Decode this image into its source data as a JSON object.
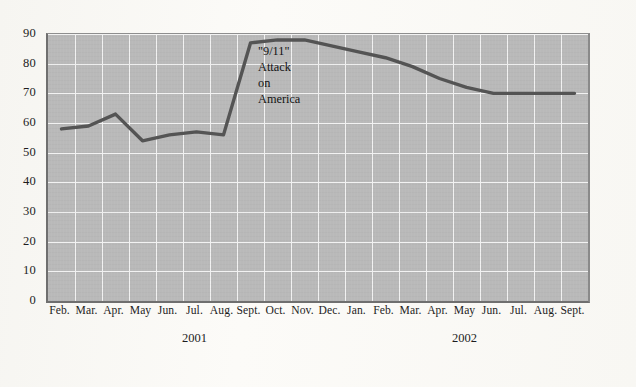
{
  "chart_data": {
    "type": "line",
    "title": "",
    "subtitle": "",
    "xlabel": "",
    "ylabel": "",
    "ylim": [
      0,
      90
    ],
    "ytick_step": 10,
    "yticks": [
      0,
      10,
      20,
      30,
      40,
      50,
      60,
      70,
      80,
      90
    ],
    "ytick_labels": [
      "0",
      "10",
      "20",
      "30",
      "40",
      "50",
      "60",
      "70",
      "80",
      "90"
    ],
    "grid": true,
    "legend": null,
    "legend_position": "none",
    "categories": [
      "Feb.",
      "Mar.",
      "Apr.",
      "May",
      "Jun.",
      "Jul.",
      "Aug.",
      "Sept.",
      "Oct.",
      "Nov.",
      "Dec.",
      "Jan.",
      "Feb.",
      "Mar.",
      "Apr.",
      "May",
      "Jun.",
      "Jul.",
      "Aug.",
      "Sept."
    ],
    "values": [
      58,
      59,
      63,
      54,
      56,
      57,
      56,
      87,
      88,
      88,
      86,
      84,
      82,
      79,
      75,
      72,
      70,
      70,
      70,
      70
    ],
    "series": [
      {
        "name": "Presidential approval",
        "values": [
          58,
          59,
          63,
          54,
          56,
          57,
          56,
          87,
          88,
          88,
          86,
          84,
          82,
          79,
          75,
          72,
          70,
          70,
          70,
          70
        ]
      }
    ],
    "year_groups": [
      {
        "label": "2001",
        "start_index": 0,
        "end_index": 10
      },
      {
        "label": "2002",
        "start_index": 11,
        "end_index": 19
      }
    ],
    "annotations": [
      {
        "name": "nine-eleven-annotation",
        "lines": [
          "\"9/11\"",
          "Attack",
          "on",
          "America"
        ],
        "at_category": "Sept.",
        "at_index": 7
      }
    ],
    "colors": {
      "plot_background": "#b9b9b9",
      "gridline": "#f2f2f2",
      "series_line": "#545454",
      "axis": "#6f6f6f",
      "text": "#1d1d1d",
      "page_background": "#faf9f6"
    }
  }
}
